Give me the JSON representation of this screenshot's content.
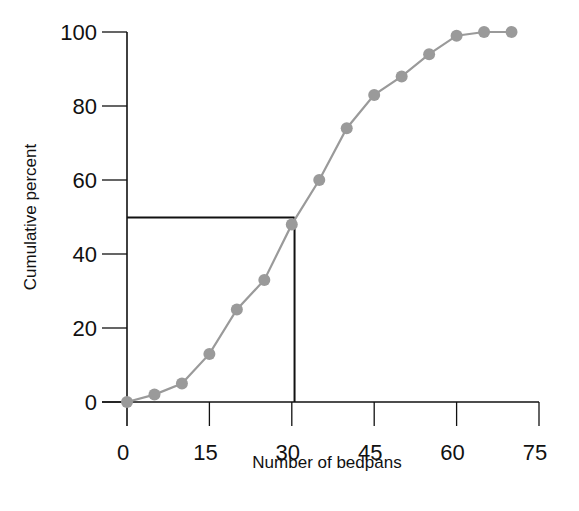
{
  "chart_data": {
    "type": "line",
    "title": "",
    "xlabel": "Number of bedpans",
    "ylabel": "Cumulative percent",
    "xlim": [
      0,
      75
    ],
    "ylim": [
      0,
      100
    ],
    "x_ticks": [
      0,
      15,
      30,
      45,
      60,
      75
    ],
    "y_ticks": [
      0,
      20,
      40,
      60,
      80,
      100
    ],
    "grid": false,
    "legend": null,
    "series": [
      {
        "name": "Cumulative percent",
        "x": [
          0,
          5,
          10,
          15,
          20,
          25,
          30,
          35,
          40,
          45,
          50,
          55,
          60,
          65,
          70
        ],
        "values": [
          0,
          2,
          5,
          13,
          25,
          33,
          48,
          60,
          74,
          83,
          88,
          94,
          99,
          100,
          100
        ],
        "color": "#9a9a9a",
        "marker": "circle"
      }
    ],
    "annotations": [
      {
        "type": "median-guide",
        "x": 30.5,
        "y": 50,
        "description": "Horizontal line at 50% to curve, vertical line down to x-axis"
      }
    ]
  },
  "colors": {
    "series": "#9a9a9a",
    "axis": "#111111",
    "guide": "#111111"
  }
}
